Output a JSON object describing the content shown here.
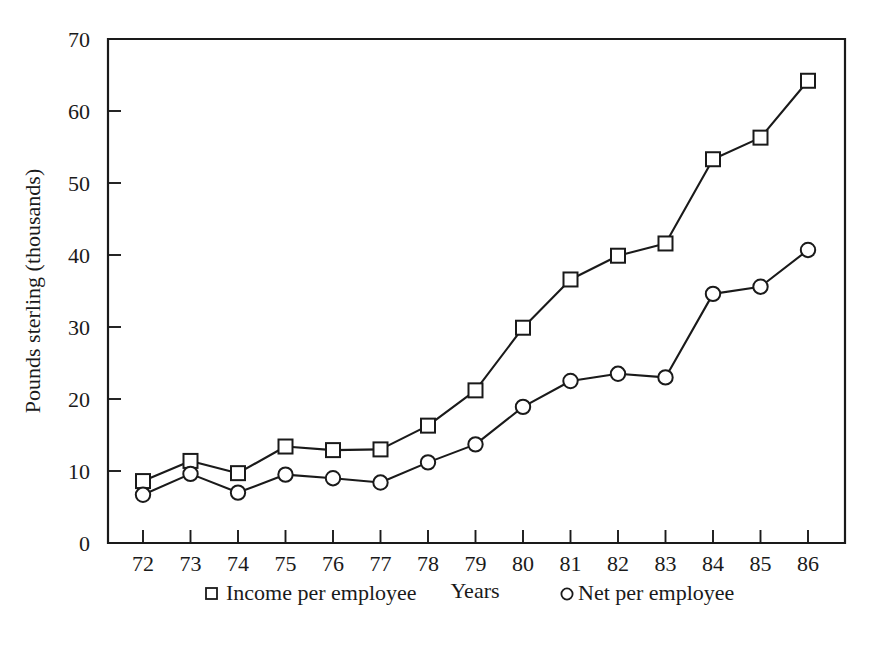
{
  "chart_data": {
    "type": "line",
    "title": "",
    "xlabel": "Years",
    "ylabel": "Pounds sterling (thousands)",
    "categories": [
      "72",
      "73",
      "74",
      "75",
      "76",
      "77",
      "78",
      "79",
      "80",
      "81",
      "82",
      "83",
      "84",
      "85",
      "86"
    ],
    "x_tick_labels": [
      "72",
      "73",
      "74",
      "75",
      "76",
      "77",
      "78",
      "79",
      "80",
      "81",
      "82",
      "83",
      "84",
      "85",
      "86"
    ],
    "y_tick_labels": [
      "0",
      "10",
      "20",
      "30",
      "40",
      "50",
      "60",
      "70"
    ],
    "y_ticks": [
      0,
      10,
      20,
      30,
      40,
      50,
      60,
      70
    ],
    "ylim": [
      0,
      70
    ],
    "xlim_categories": 15,
    "grid": false,
    "legend_position": "below-axis",
    "series": [
      {
        "name": "Income per employee",
        "marker": "square",
        "values": [
          8.6,
          11.4,
          9.7,
          13.4,
          12.9,
          13.0,
          16.3,
          21.2,
          29.9,
          36.6,
          39.9,
          41.6,
          53.3,
          56.3,
          64.2
        ]
      },
      {
        "name": "Net per employee",
        "marker": "circle",
        "values": [
          6.7,
          9.6,
          7.0,
          9.5,
          9.0,
          8.4,
          11.2,
          13.7,
          18.9,
          22.5,
          23.5,
          23.0,
          34.6,
          35.6,
          40.7
        ]
      }
    ]
  },
  "legend": {
    "items": [
      {
        "label": "Income per employee",
        "marker": "square"
      },
      {
        "label": "Net per employee",
        "marker": "circle"
      }
    ],
    "center_label": "Years"
  },
  "colors": {
    "ink": "#1a1a1a",
    "paper": "#ffffff",
    "marker_fill": "#ffffff"
  }
}
